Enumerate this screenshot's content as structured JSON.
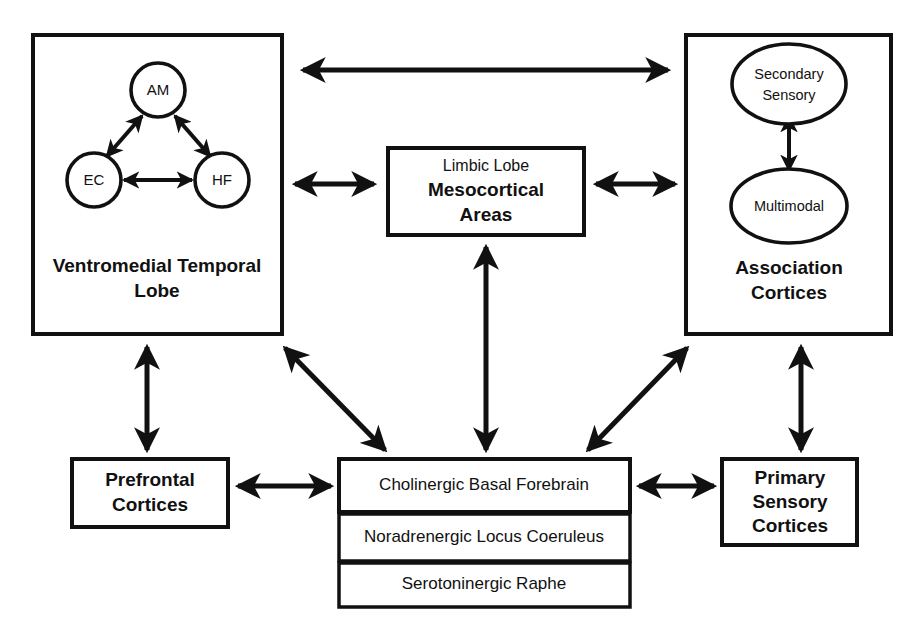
{
  "diagram": {
    "background_color": "#ffffff",
    "stroke_color": "#111111"
  },
  "boxes": {
    "ventromedial_temporal_lobe": {
      "label_line1": "Ventromedial Temporal",
      "label_line2": "Lobe",
      "nodes": [
        {
          "id": "AM",
          "label": "AM"
        },
        {
          "id": "EC",
          "label": "EC"
        },
        {
          "id": "HF",
          "label": "HF"
        }
      ]
    },
    "mesocortical": {
      "label_line1": "Limbic Lobe",
      "label_line2": "Mesocortical",
      "label_line3": "Areas"
    },
    "association_cortices": {
      "label_line1": "Association",
      "label_line2": "Cortices",
      "nodes": [
        {
          "id": "secondary-sensory",
          "label_line1": "Secondary",
          "label_line2": "Sensory"
        },
        {
          "id": "multimodal",
          "label_line1": "Multimodal"
        }
      ]
    },
    "prefrontal_cortices": {
      "label_line1": "Prefrontal",
      "label_line2": "Cortices"
    },
    "primary_sensory_cortices": {
      "label_line1": "Primary",
      "label_line2": "Sensory",
      "label_line3": "Cortices"
    },
    "neuromodulatory_stack": {
      "rows": [
        {
          "id": "cholinergic-basal-forebrain",
          "label": "Cholinergic Basal Forebrain"
        },
        {
          "id": "noradrenergic-locus-coeruleus",
          "label": "Noradrenergic Locus Coeruleus"
        },
        {
          "id": "serotoninergic-raphe",
          "label": "Serotoninergic Raphe"
        }
      ]
    }
  },
  "connections": [
    {
      "id": "vmtl-to-association",
      "from": "ventromedial-temporal-lobe",
      "to": "association-cortices",
      "kind": "bidirectional"
    },
    {
      "id": "vmtl-to-mesocortical",
      "from": "ventromedial-temporal-lobe",
      "to": "mesocortical-areas",
      "kind": "bidirectional"
    },
    {
      "id": "mesocortical-to-association",
      "from": "mesocortical-areas",
      "to": "association-cortices",
      "kind": "bidirectional"
    },
    {
      "id": "mesocortical-to-cholinergic",
      "from": "mesocortical-areas",
      "to": "cholinergic-basal-forebrain",
      "kind": "bidirectional"
    },
    {
      "id": "vmtl-to-prefrontal",
      "from": "ventromedial-temporal-lobe",
      "to": "prefrontal-cortices",
      "kind": "bidirectional"
    },
    {
      "id": "vmtl-to-cholinergic",
      "from": "ventromedial-temporal-lobe",
      "to": "cholinergic-basal-forebrain",
      "kind": "bidirectional"
    },
    {
      "id": "association-to-cholinergic",
      "from": "association-cortices",
      "to": "cholinergic-basal-forebrain",
      "kind": "bidirectional"
    },
    {
      "id": "association-to-primary-sensory",
      "from": "association-cortices",
      "to": "primary-sensory-cortices",
      "kind": "bidirectional"
    },
    {
      "id": "prefrontal-to-cholinergic",
      "from": "prefrontal-cortices",
      "to": "cholinergic-basal-forebrain",
      "kind": "bidirectional"
    },
    {
      "id": "cholinergic-to-primary-sensory",
      "from": "cholinergic-basal-forebrain",
      "to": "primary-sensory-cortices",
      "kind": "bidirectional"
    },
    {
      "id": "am-to-ec",
      "from": "AM",
      "to": "EC",
      "kind": "bidirectional"
    },
    {
      "id": "am-to-hf",
      "from": "AM",
      "to": "HF",
      "kind": "bidirectional"
    },
    {
      "id": "ec-to-hf",
      "from": "EC",
      "to": "HF",
      "kind": "bidirectional"
    },
    {
      "id": "secondary-to-multimodal",
      "from": "secondary-sensory",
      "to": "multimodal",
      "kind": "bidirectional"
    }
  ]
}
